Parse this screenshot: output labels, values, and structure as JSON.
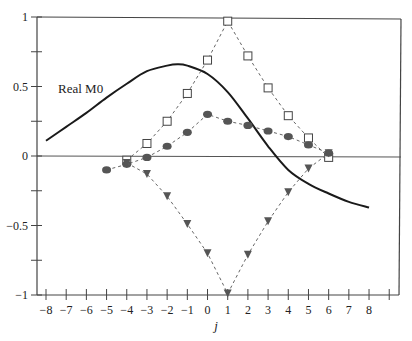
{
  "chart_data": {
    "type": "line",
    "title": "",
    "xlabel": "j",
    "ylabel": "",
    "xlim": [
      -8.45,
      9.6
    ],
    "ylim": [
      -1,
      1
    ],
    "grid": false,
    "legend_position": "none",
    "x_ticks": [
      -8,
      -7,
      -6,
      -5,
      -4,
      -3,
      -2,
      -1,
      0,
      1,
      2,
      3,
      4,
      5,
      6,
      7,
      8,
      9
    ],
    "x_tick_labels": [
      "−8",
      "−7",
      "−6",
      "−5",
      "−4",
      "−3",
      "−2",
      "−1",
      "0",
      "1",
      "2",
      "3",
      "4",
      "5",
      "6",
      "7",
      "8",
      ""
    ],
    "y_ticks": [
      1,
      0.75,
      0.5,
      0.25,
      0,
      -0.25,
      -0.5,
      -0.75,
      -1
    ],
    "y_tick_labels": [
      "1",
      "",
      "0.5",
      "",
      "0",
      "",
      "−0.5",
      "",
      "−1"
    ],
    "zero_line": true,
    "annotations": [
      {
        "text": "Real M0",
        "x": -7.3,
        "y": 0.5
      }
    ],
    "series": [
      {
        "name": "Real M0",
        "style": "solid",
        "marker": "none",
        "color": "#1a1a1a",
        "x": [
          -8,
          -7,
          -6,
          -5,
          -4,
          -3,
          -2,
          -1.5,
          -1,
          0,
          1,
          2,
          3,
          4,
          5,
          6,
          7,
          8
        ],
        "values": [
          0.11,
          0.21,
          0.31,
          0.42,
          0.52,
          0.61,
          0.65,
          0.66,
          0.65,
          0.59,
          0.46,
          0.27,
          0.07,
          -0.1,
          -0.2,
          -0.27,
          -0.33,
          -0.37
        ]
      },
      {
        "name": "squares",
        "style": "dashed",
        "marker": "square-open",
        "color": "#555555",
        "x": [
          -4,
          -3,
          -2,
          -1,
          0,
          1,
          2,
          3,
          4,
          5,
          6
        ],
        "values": [
          -0.03,
          0.09,
          0.25,
          0.45,
          0.69,
          0.97,
          0.72,
          0.49,
          0.29,
          0.13,
          -0.01
        ]
      },
      {
        "name": "circles",
        "style": "dashed",
        "marker": "circle-filled",
        "color": "#555555",
        "x": [
          -5,
          -4,
          -3,
          -2,
          -1,
          0,
          1,
          2,
          3,
          4,
          5,
          6
        ],
        "values": [
          -0.1,
          -0.06,
          -0.01,
          0.07,
          0.17,
          0.3,
          0.25,
          0.22,
          0.18,
          0.14,
          0.08,
          0.02
        ]
      },
      {
        "name": "triangles",
        "style": "dashed",
        "marker": "triangle-down-filled",
        "color": "#555555",
        "x": [
          -4,
          -3,
          -2,
          -1,
          0,
          1,
          2,
          3,
          4,
          5,
          6
        ],
        "values": [
          -0.05,
          -0.13,
          -0.29,
          -0.49,
          -0.7,
          -0.99,
          -0.71,
          -0.47,
          -0.26,
          -0.09,
          0.02
        ]
      }
    ]
  }
}
